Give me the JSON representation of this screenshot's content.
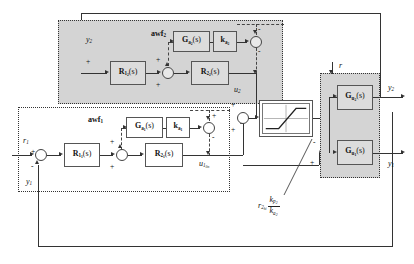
{
  "diagram": {
    "regions": {
      "awf2_label": "awf",
      "awf2_sub": "2",
      "awf1_label": "awf",
      "awf1_sub": "1"
    },
    "blocks": {
      "R1_2": {
        "name": "R",
        "sub": "1",
        "subsub": "2",
        "arg": "(s)"
      },
      "R2_2": {
        "name": "R",
        "sub": "2",
        "subsub": "2",
        "arg": "(s)"
      },
      "Ga_2": {
        "name": "G",
        "sub": "a",
        "subsub": "2",
        "arg": "(s)"
      },
      "ka_2": {
        "name": "k",
        "sub": "a",
        "subsub": "2",
        "arg": ""
      },
      "R1_1": {
        "name": "R",
        "sub": "1",
        "subsub": "1",
        "arg": "(s)"
      },
      "R2_1": {
        "name": "R",
        "sub": "2",
        "subsub": "1",
        "arg": "(s)"
      },
      "Ga_1": {
        "name": "G",
        "sub": "a",
        "subsub": "1",
        "arg": "(s)"
      },
      "ka_1": {
        "name": "k",
        "sub": "a",
        "subsub": "1",
        "arg": ""
      },
      "Gu_2": {
        "name": "G",
        "sub": "u",
        "subsub": "2",
        "arg": "(s)"
      },
      "Gu_1": {
        "name": "G",
        "sub": "u",
        "subsub": "1",
        "arg": "(s)"
      },
      "saturation": {
        "name": "saturation-nonlinearity"
      }
    },
    "signals": {
      "r1": "r",
      "r1_sub": "1",
      "y1_fb": "y",
      "y1_fb_sub": "1",
      "y1_out": "y",
      "y1_out_sub": "1",
      "y2_in": "y",
      "y2_in_sub": "2",
      "y2_out": "y",
      "y2_out_sub": "2",
      "u2": "u",
      "u2_sub": "2",
      "u1lin": "u",
      "u1lin_sub": "1",
      "u1lin_subsub": "lin",
      "u": "u",
      "r": "r"
    },
    "annotation": {
      "base": "r",
      "base_sub": "2",
      "base_subsub": "hi",
      "num": "k",
      "num_sub": "p",
      "num_subsub": "2",
      "den": "k",
      "den_sub": "a",
      "den_subsub": "2"
    },
    "signs": {
      "plus": "+",
      "minus": "-"
    },
    "colors": {
      "shaded_region": "#d4d4d4",
      "line": "#333333",
      "block_fill": "#ffffff",
      "background": "#ffffff"
    }
  }
}
